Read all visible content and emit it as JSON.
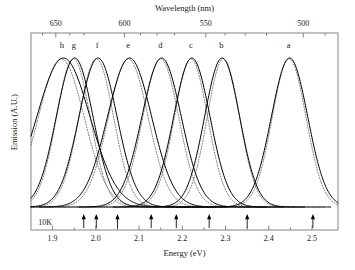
{
  "chart_data": {
    "type": "line",
    "title": "",
    "xlabel": "Energy (eV)",
    "ylabel": "Emission (A.U.)",
    "top_axis_label": "Wavelength (nm)",
    "xlim": [
      1.85,
      2.56
    ],
    "ylim": [
      0,
      1.08
    ],
    "grid": false,
    "legend": "none",
    "annotations": [
      {
        "name": "temperature",
        "text": "10K",
        "x": 1.862,
        "y": 0.045
      }
    ],
    "x_ticks": [
      1.9,
      2.0,
      2.1,
      2.2,
      2.3,
      2.4,
      2.5
    ],
    "x_tick_labels": [
      "1.9",
      "2.0",
      "2.1",
      "2.2",
      "2.3",
      "2.4",
      "2.5"
    ],
    "x_minor_ticks": [
      1.95,
      2.05,
      2.15,
      2.25,
      2.35,
      2.45
    ],
    "top_tick_labels": [
      "650",
      "600",
      "550",
      "500"
    ],
    "top_tick_energies": [
      1.9074,
      2.0664,
      2.2543,
      2.4797
    ],
    "top_minor_tick_energies": [
      1.8767,
      1.9395,
      1.9728,
      2.1032,
      2.1417,
      2.182,
      2.2988,
      2.3455,
      2.3947,
      2.5303
    ],
    "y_ticks": [],
    "y_tick_labels": [],
    "series": [
      {
        "name": "h",
        "label": "h",
        "style": "solid",
        "peak_energy": 1.925,
        "amplitude": 1.0,
        "width_ev": 0.0615,
        "label_x": 1.921,
        "label_y": 1.045
      },
      {
        "name": "g",
        "label": "g",
        "style": "solid",
        "peak_energy": 1.951,
        "amplitude": 1.0,
        "width_ev": 0.0425,
        "label_x": 1.949,
        "label_y": 1.045
      },
      {
        "name": "f",
        "label": "f",
        "style": "solid",
        "peak_energy": 2.005,
        "amplitude": 1.0,
        "width_ev": 0.044,
        "label_x": 2.003,
        "label_y": 1.045
      },
      {
        "name": "e",
        "label": "e",
        "style": "solid",
        "peak_energy": 2.078,
        "amplitude": 1.0,
        "width_ev": 0.051,
        "label_x": 2.075,
        "label_y": 1.045
      },
      {
        "name": "d",
        "label": "d",
        "style": "solid",
        "peak_energy": 2.152,
        "amplitude": 1.0,
        "width_ev": 0.0455,
        "label_x": 2.149,
        "label_y": 1.045
      },
      {
        "name": "c",
        "label": "c",
        "style": "solid",
        "peak_energy": 2.222,
        "amplitude": 1.0,
        "width_ev": 0.042,
        "label_x": 2.22,
        "label_y": 1.045
      },
      {
        "name": "b",
        "label": "b",
        "style": "solid",
        "peak_energy": 2.292,
        "amplitude": 1.0,
        "width_ev": 0.0405,
        "label_x": 2.29,
        "label_y": 1.045
      },
      {
        "name": "a",
        "label": "a",
        "style": "solid",
        "peak_energy": 2.448,
        "amplitude": 1.0,
        "width_ev": 0.042,
        "label_x": 2.446,
        "label_y": 1.045
      }
    ],
    "fit_series": [
      {
        "name": "h-fit",
        "style": "dotted",
        "peak_energy": 1.92,
        "amplitude": 0.995,
        "width_ev": 0.053
      },
      {
        "name": "g-fit",
        "style": "dotted",
        "peak_energy": 1.948,
        "amplitude": 0.995,
        "width_ev": 0.039
      },
      {
        "name": "f-fit",
        "style": "dotted",
        "peak_energy": 2.001,
        "amplitude": 0.995,
        "width_ev": 0.04
      },
      {
        "name": "e-fit",
        "style": "dotted",
        "peak_energy": 2.075,
        "amplitude": 0.995,
        "width_ev": 0.046
      },
      {
        "name": "d-fit",
        "style": "dotted",
        "peak_energy": 2.15,
        "amplitude": 0.995,
        "width_ev": 0.0415
      },
      {
        "name": "c-fit",
        "style": "dotted",
        "peak_energy": 2.22,
        "amplitude": 0.995,
        "width_ev": 0.0385
      },
      {
        "name": "b-fit",
        "style": "dotted",
        "peak_energy": 2.295,
        "amplitude": 0.995,
        "width_ev": 0.0375
      },
      {
        "name": "a-fit",
        "style": "dotted",
        "peak_energy": 2.447,
        "amplitude": 0.995,
        "width_ev": 0.039
      }
    ],
    "arrow_markers": {
      "name": "absorption-onset-arrows",
      "direction": "up",
      "energies": [
        1.972,
        2.001,
        2.05,
        2.128,
        2.186,
        2.262,
        2.35,
        2.502
      ]
    },
    "colors": {
      "curve": "#000000",
      "fit": "#555555",
      "axis": "#777777",
      "text": "#1a1a1a",
      "background": "#ffffff"
    }
  }
}
